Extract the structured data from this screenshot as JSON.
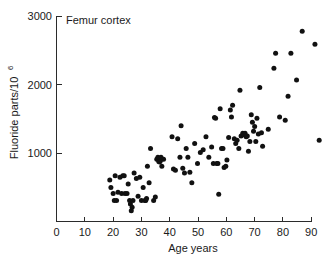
{
  "chart_data": {
    "type": "scatter",
    "title": "Femur cortex",
    "xlabel": "Age years",
    "ylabel": "Fluoride parts/10",
    "ylabel_superscript": "6",
    "xlim": [
      0,
      95
    ],
    "ylim": [
      0,
      3000
    ],
    "xticks": [
      0,
      10,
      20,
      30,
      40,
      50,
      60,
      70,
      80,
      90
    ],
    "xtick_labels": [
      "0",
      "10",
      "20",
      "30",
      "40",
      "50",
      "60",
      "70",
      "80",
      "90"
    ],
    "yticks": [
      1000,
      2000,
      3000
    ],
    "ytick_labels": [
      "1000",
      "2000",
      "3000"
    ],
    "grid": false,
    "legend": false,
    "marker": "filled-circle",
    "marker_color": "#111111",
    "marker_size_px": 5,
    "axis_color": "#2b2b2b",
    "background_color": "#ffffff",
    "n_points": 110,
    "points": [
      [
        19.0,
        600
      ],
      [
        19.4,
        490
      ],
      [
        20.2,
        400
      ],
      [
        20.6,
        300
      ],
      [
        20.9,
        660
      ],
      [
        21.4,
        300
      ],
      [
        21.9,
        420
      ],
      [
        22.6,
        640
      ],
      [
        23.2,
        400
      ],
      [
        23.6,
        660
      ],
      [
        24.1,
        660
      ],
      [
        24.4,
        400
      ],
      [
        25.1,
        400
      ],
      [
        25.5,
        540
      ],
      [
        26.0,
        300
      ],
      [
        26.3,
        250
      ],
      [
        26.6,
        150
      ],
      [
        26.9,
        200
      ],
      [
        27.2,
        300
      ],
      [
        27.6,
        700
      ],
      [
        28.4,
        620
      ],
      [
        29.0,
        360
      ],
      [
        29.6,
        640
      ],
      [
        30.2,
        300
      ],
      [
        30.8,
        490
      ],
      [
        31.4,
        300
      ],
      [
        31.7,
        300
      ],
      [
        32.0,
        330
      ],
      [
        32.3,
        800
      ],
      [
        32.9,
        560
      ],
      [
        33.4,
        1060
      ],
      [
        34.5,
        300
      ],
      [
        35.1,
        350
      ],
      [
        35.6,
        900
      ],
      [
        36.0,
        930
      ],
      [
        36.3,
        870
      ],
      [
        36.6,
        860
      ],
      [
        36.9,
        880
      ],
      [
        37.1,
        930
      ],
      [
        37.4,
        800
      ],
      [
        38.0,
        900
      ],
      [
        41.0,
        1230
      ],
      [
        41.5,
        760
      ],
      [
        42.2,
        740
      ],
      [
        43.0,
        1200
      ],
      [
        43.8,
        930
      ],
      [
        44.2,
        1390
      ],
      [
        44.8,
        770
      ],
      [
        45.4,
        700
      ],
      [
        46.0,
        1060
      ],
      [
        46.6,
        930
      ],
      [
        47.3,
        710
      ],
      [
        48.0,
        560
      ],
      [
        49.0,
        1130
      ],
      [
        50.0,
        840
      ],
      [
        51.0,
        1000
      ],
      [
        52.0,
        1040
      ],
      [
        53.0,
        1230
      ],
      [
        54.0,
        930
      ],
      [
        55.0,
        1080
      ],
      [
        55.6,
        840
      ],
      [
        56.0,
        1510
      ],
      [
        56.4,
        1500
      ],
      [
        56.8,
        840
      ],
      [
        57.2,
        840
      ],
      [
        57.5,
        390
      ],
      [
        58.0,
        1640
      ],
      [
        58.5,
        1060
      ],
      [
        59.0,
        1060
      ],
      [
        59.4,
        780
      ],
      [
        60.0,
        800
      ],
      [
        60.4,
        890
      ],
      [
        61.0,
        1220
      ],
      [
        61.6,
        1620
      ],
      [
        62.0,
        1520
      ],
      [
        62.4,
        1690
      ],
      [
        63.0,
        1200
      ],
      [
        63.5,
        1130
      ],
      [
        64.0,
        1180
      ],
      [
        64.6,
        1060
      ],
      [
        65.0,
        1910
      ],
      [
        65.4,
        1240
      ],
      [
        66.0,
        1280
      ],
      [
        66.4,
        1260
      ],
      [
        66.8,
        1280
      ],
      [
        67.2,
        1230
      ],
      [
        67.6,
        1240
      ],
      [
        68.0,
        1020
      ],
      [
        68.5,
        1160
      ],
      [
        69.0,
        1550
      ],
      [
        69.4,
        1440
      ],
      [
        69.8,
        1310
      ],
      [
        70.2,
        1380
      ],
      [
        70.6,
        1160
      ],
      [
        71.0,
        1500
      ],
      [
        71.5,
        1270
      ],
      [
        72.0,
        1950
      ],
      [
        72.6,
        1290
      ],
      [
        73.0,
        1090
      ],
      [
        75.0,
        1340
      ],
      [
        77.0,
        2230
      ],
      [
        77.6,
        2450
      ],
      [
        79.0,
        1520
      ],
      [
        81.0,
        1470
      ],
      [
        82.0,
        1820
      ],
      [
        83.0,
        2450
      ],
      [
        85.0,
        2060
      ],
      [
        87.0,
        2770
      ],
      [
        91.5,
        2580
      ],
      [
        93.0,
        1180
      ]
    ]
  }
}
